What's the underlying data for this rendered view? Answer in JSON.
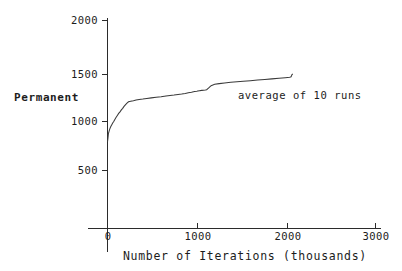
{
  "chart_data": {
    "type": "line",
    "title": "",
    "subtitle": "",
    "xlabel": "Number of Iterations (thousands)",
    "ylabel": "Permanent",
    "xlim": [
      0,
      3000
    ],
    "ylim": [
      0,
      2000
    ],
    "grid": false,
    "legend": null,
    "annotations": [
      {
        "text": "average of 10 runs",
        "x": 1280,
        "y": 1200
      }
    ],
    "xticks": [
      0,
      1000,
      2000,
      3000
    ],
    "xtick_labels": [
      "0",
      "1000",
      "2000",
      "3000"
    ],
    "yticks": [
      500,
      1000,
      1500,
      2000
    ],
    "ytick_labels": [
      "500",
      "1000",
      "1500",
      "2000"
    ],
    "series": [
      {
        "name": "average of 10 runs",
        "color": "#3a3a3a",
        "x": [
          0,
          5,
          10,
          18,
          25,
          32,
          40,
          48,
          58,
          70,
          82,
          95,
          110,
          125,
          140,
          155,
          170,
          185,
          200,
          215,
          235,
          260,
          290,
          320,
          355,
          395,
          440,
          490,
          545,
          600,
          655,
          700,
          745,
          790,
          830,
          870,
          905,
          940,
          975,
          1000,
          1010,
          1030,
          1055,
          1075,
          1095,
          1110,
          1130,
          1160,
          1200,
          1250,
          1310,
          1380,
          1450,
          1520,
          1600,
          1680,
          1760,
          1840,
          1920,
          1990,
          2040,
          2055,
          2065,
          2075
        ],
        "y": [
          800,
          835,
          880,
          905,
          925,
          940,
          955,
          968,
          985,
          1000,
          1020,
          1040,
          1060,
          1080,
          1095,
          1115,
          1130,
          1150,
          1165,
          1180,
          1195,
          1200,
          1205,
          1212,
          1218,
          1222,
          1228,
          1234,
          1240,
          1245,
          1252,
          1258,
          1262,
          1268,
          1272,
          1278,
          1285,
          1290,
          1296,
          1300,
          1302,
          1305,
          1308,
          1310,
          1312,
          1315,
          1330,
          1355,
          1368,
          1375,
          1382,
          1388,
          1393,
          1398,
          1404,
          1410,
          1416,
          1422,
          1428,
          1434,
          1438,
          1442,
          1465,
          1470
        ]
      }
    ]
  },
  "labels": {
    "y_axis_title": "Permanent",
    "x_axis_title": "Number of Iterations (thousands)",
    "note": "average of 10 runs",
    "y_ticks": [
      "2000",
      "1500",
      "1000",
      "500"
    ],
    "x_ticks": [
      "0",
      "1000",
      "2000",
      "3000"
    ]
  },
  "colors": {
    "axis": "#2b2b2b",
    "curve": "#3a3a3a",
    "text": "#1c1c1c",
    "background": "#ffffff"
  }
}
